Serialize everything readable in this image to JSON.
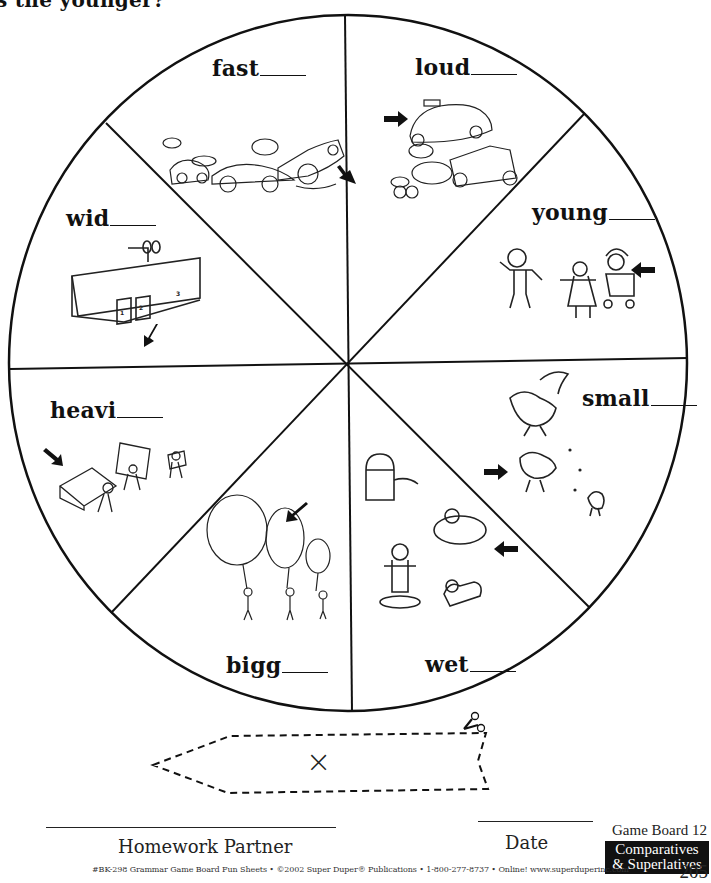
{
  "header_fragment": "s the younger?",
  "board": {
    "segments": [
      {
        "id": "fast",
        "word": "fast",
        "illustration": "race-cars-icon",
        "caption_words": [
          "VROOM!",
          "VROOM!",
          "VROOM!"
        ]
      },
      {
        "id": "loud",
        "word": "loud",
        "illustration": "traffic-vehicles-icon",
        "caption_words": [
          "TAXI",
          "TAXI",
          "BEEP!",
          "BEEP!",
          "BEEP!"
        ]
      },
      {
        "id": "young",
        "word": "young",
        "illustration": "children-stroller-icon"
      },
      {
        "id": "small",
        "word": "small",
        "illustration": "birds-icon"
      },
      {
        "id": "wet",
        "word": "wet",
        "illustration": "hydrant-kids-dog-icon"
      },
      {
        "id": "bigg",
        "word": "bigg",
        "illustration": "balloons-icon"
      },
      {
        "id": "heavi",
        "word": "heavi",
        "illustration": "boxes-carriers-icon",
        "caption_words": [
          "BOWLING BALLS",
          "BOOKS"
        ]
      },
      {
        "id": "wid",
        "word": "wid",
        "illustration": "fire-station-icon",
        "caption_words": [
          "FIRE DEPARTMENT",
          "1",
          "2",
          "3"
        ]
      }
    ]
  },
  "spinner_cutout": {
    "mark": "×",
    "icon": "scissors-icon"
  },
  "signature": {
    "partner_label": "Homework Partner",
    "date_label": "Date"
  },
  "game_board_label": "Game Board 12",
  "category_badge": {
    "line1": "Comparatives",
    "line2": "& Superlatives"
  },
  "page_number": "205",
  "footer": "#BK-298 Grammar Game Board Fun Sheets  •  ©2002 Super Duper® Publications  •  1-800-277-8737  •  Online! www.superduperinc.com"
}
